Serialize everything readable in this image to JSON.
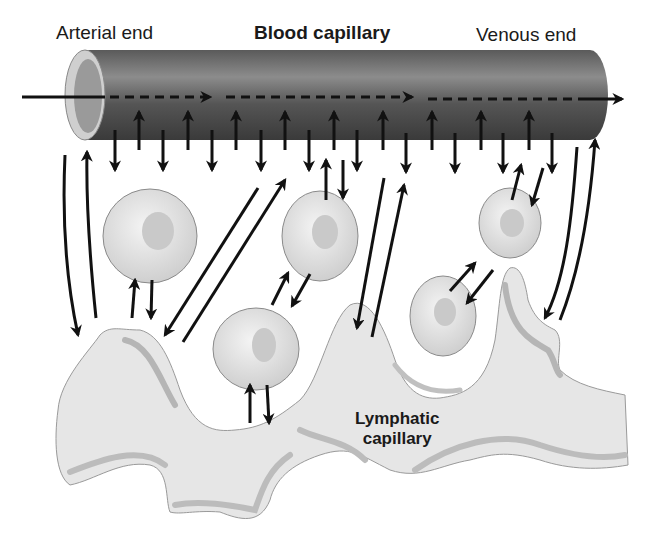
{
  "labels": {
    "arterial_end": "Arterial end",
    "blood_capillary": "Blood capillary",
    "venous_end": "Venous end",
    "lymphatic_line1": "Lymphatic",
    "lymphatic_line2": "capillary"
  },
  "colors": {
    "tube_dark": "#3f3f3f",
    "tube_light": "#8a8a8a",
    "lymph_fill": "#e6e6e6",
    "lymph_shadow": "#b5b5b5",
    "cell_fill": "#e2e2e2",
    "nucleus": "#c8c8c8",
    "arrow": "#111111"
  }
}
